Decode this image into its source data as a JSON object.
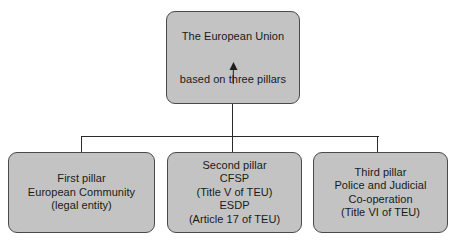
{
  "diagram": {
    "type": "hierarchy-tree",
    "root": {
      "title": "The European Union",
      "subtitle": "based on three pillars",
      "arrow": "up-arrow"
    },
    "pillars": [
      {
        "id": "first-pillar",
        "lines": [
          "First pillar",
          "European Community",
          "(legal entity)"
        ]
      },
      {
        "id": "second-pillar",
        "lines": [
          "Second pillar",
          "CFSP",
          "(Title V of TEU)",
          "ESDP",
          "(Article 17 of TEU)"
        ]
      },
      {
        "id": "third-pillar",
        "lines": [
          "Third pillar",
          "Police and Judicial",
          "Co-operation",
          "(Title VI of TEU)"
        ]
      }
    ],
    "colors": {
      "box_fill": "#c3c3c3",
      "box_border": "#4a4a4a",
      "connector": "#2a2a2a",
      "text": "#1a1a1a",
      "background": "#ffffff"
    }
  }
}
